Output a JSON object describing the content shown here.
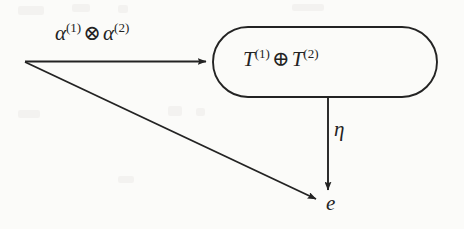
{
  "figure": {
    "type": "flow-diagram",
    "background_color": "#fbfbf9",
    "ink_color": "#232323"
  },
  "nodes": {
    "source_vertex": {
      "name": "source-vertex",
      "x": 24,
      "y": 61,
      "label": ""
    },
    "process_box": {
      "name": "process-box",
      "shape": "stadium",
      "x": 212,
      "y": 26,
      "width": 226,
      "height": 72,
      "label_parts": {
        "first_symbol": "T",
        "first_sup": "(1)",
        "operator": "⊕",
        "second_symbol": "T",
        "second_sup": "(2)"
      },
      "label_text": "T(1) ⊕ T(2)"
    },
    "terminal": {
      "name": "terminal-node-e",
      "label": "e",
      "x": 327,
      "y": 197
    }
  },
  "edges": [
    {
      "name": "edge-alpha",
      "from": "source-vertex",
      "to": "process-box",
      "orientation": "horizontal",
      "arrowhead": true,
      "label_parts": {
        "first_symbol": "α",
        "first_sup": "(1)",
        "operator": "⊗",
        "second_symbol": "α",
        "second_sup": "(2)"
      },
      "label_text": "α(1) ⊗ α(2)"
    },
    {
      "name": "edge-eta",
      "from": "process-box",
      "to": "terminal-node-e",
      "orientation": "vertical",
      "arrowhead": true,
      "label": "η"
    },
    {
      "name": "edge-diagonal",
      "from": "source-vertex",
      "to": "terminal-node-e",
      "orientation": "diagonal",
      "arrowhead": true,
      "label": ""
    }
  ]
}
